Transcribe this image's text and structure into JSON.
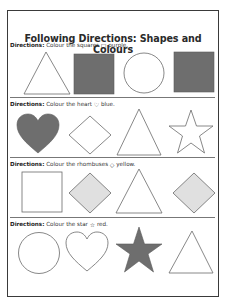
{
  "title": "Following Directions: Shapes and Colours",
  "colors": {
    "border": "#3a3a3a",
    "dark_fill": "#6e6e6e",
    "light_fill": "#e0e0e0",
    "outline": "#6a6a6a"
  },
  "sections": [
    {
      "label": "Directions:",
      "instruction_pre": "Colour the squares",
      "icon": "square-icon",
      "icon_glyph": "□",
      "instruction_post": "purple.",
      "shapes": [
        "triangle-outline",
        "square-filled",
        "circle-outline",
        "square-filled"
      ]
    },
    {
      "label": "Directions:",
      "instruction_pre": "Colour the heart",
      "icon": "heart-icon",
      "icon_glyph": "♡",
      "instruction_post": "blue.",
      "shapes": [
        "heart-filled",
        "rhombus-outline",
        "triangle-outline",
        "star-outline"
      ]
    },
    {
      "label": "Directions:",
      "instruction_pre": "Colour the rhombuses",
      "icon": "rhombus-icon",
      "icon_glyph": "◇",
      "instruction_post": "yellow.",
      "shapes": [
        "square-outline",
        "rhombus-light",
        "triangle-outline",
        "rhombus-light"
      ]
    },
    {
      "label": "Directions:",
      "instruction_pre": "Colour the star",
      "icon": "star-icon",
      "icon_glyph": "☆",
      "instruction_post": "red.",
      "shapes": [
        "circle-outline",
        "heart-outline",
        "star-filled",
        "triangle-outline"
      ]
    }
  ]
}
